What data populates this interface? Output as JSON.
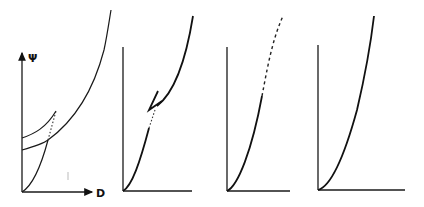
{
  "figure": {
    "y_axis_label": "Ψ",
    "x_axis_label": "D",
    "panel_count": 4,
    "panels": [
      {
        "id": 1,
        "content": "axes with arrows; two convex curves starting on Ψ axis at different heights; a rising curve from origin intersecting them, dotted segment between crossings; large upper curve"
      },
      {
        "id": 2,
        "content": "curve from origin rising, broken with dotted gap, then jumps back with an arrow and continues steeply upward"
      },
      {
        "id": 3,
        "content": "curve from origin rising, solid lower part then dashed upper part"
      },
      {
        "id": 4,
        "content": "smooth solid convex curve from origin rising steeply"
      }
    ]
  }
}
